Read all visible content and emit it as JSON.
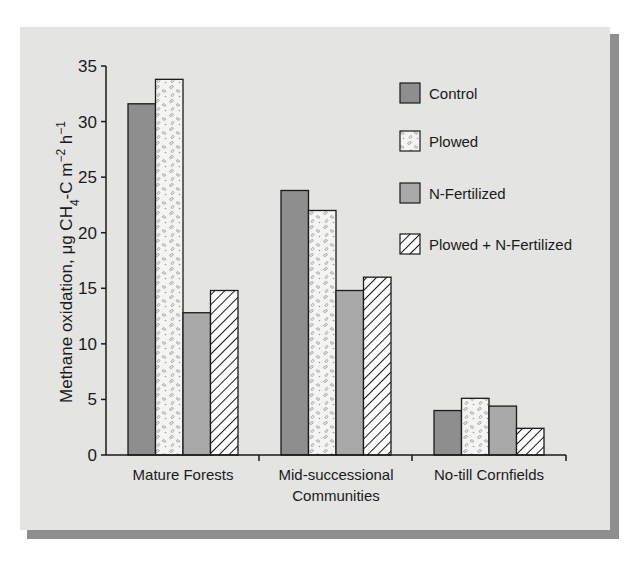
{
  "chart_data": {
    "type": "bar",
    "title": "",
    "xlabel": "",
    "ylabel": "Methane oxidation, μg CH4-C m-2 h-1",
    "ylabel_parts": {
      "main": "Methane oxidation, μg CH",
      "sub4": "4",
      "mid": "-C m",
      "sup_m": "−2",
      "h": " h",
      "sup_h": "−1"
    },
    "ylim": [
      0,
      35
    ],
    "yticks": [
      0,
      5,
      10,
      15,
      20,
      25,
      30,
      35
    ],
    "grid": false,
    "legend_position": "upper right",
    "categories": [
      "Mature Forests",
      "Mid-successional Communities",
      "No-till Cornfields"
    ],
    "category_lines": [
      [
        "Mature Forests"
      ],
      [
        "Mid-successional",
        "Communities"
      ],
      [
        "No-till Cornfields"
      ]
    ],
    "series": [
      {
        "name": "Control",
        "values": [
          31.6,
          23.8,
          4.0
        ],
        "fill": "#8e8e8e",
        "pattern": "solid-dark"
      },
      {
        "name": "Plowed",
        "values": [
          33.8,
          22.0,
          5.1
        ],
        "fill": "#f4f4f2",
        "pattern": "stipple"
      },
      {
        "name": "N-Fertilized",
        "values": [
          12.8,
          14.8,
          4.4
        ],
        "fill": "#a9a9a9",
        "pattern": "solid-light"
      },
      {
        "name": "Plowed + N-Fertilized",
        "values": [
          14.8,
          16.0,
          2.4
        ],
        "fill": "#ffffff",
        "pattern": "hatch"
      }
    ]
  },
  "colors": {
    "panel": "#e4e4e2",
    "shadow": "#8f8f8f",
    "axis": "#1a1a1a",
    "control": "#8e8e8e",
    "nfert": "#a9a9a9"
  }
}
